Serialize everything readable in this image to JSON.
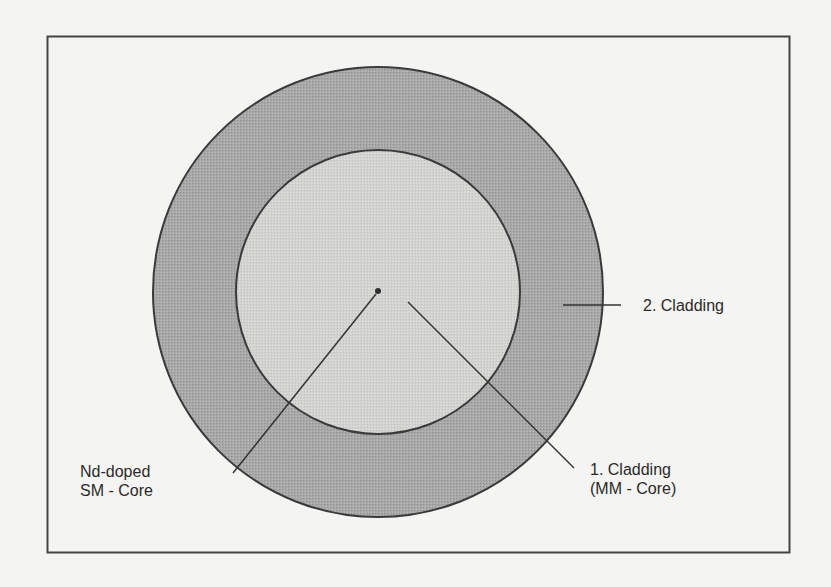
{
  "figure": {
    "type": "cross-section",
    "colors": {
      "background": "#f4f4f2",
      "frame": "#444444",
      "outer_cladding_fill": "#a6a6a6",
      "inner_cladding_fill": "#d2d2d0",
      "outline": "#3a3a3a",
      "core_dot": "#2e2e2e",
      "text": "#2a2a2a"
    },
    "regions": [
      {
        "id": "core",
        "name": "Nd-doped SM - Core"
      },
      {
        "id": "cladding1",
        "name": "1. Cladding (MM - Core)"
      },
      {
        "id": "cladding2",
        "name": "2. Cladding"
      }
    ]
  },
  "labels": {
    "core": {
      "line1": "Nd-doped",
      "line2": "SM - Core"
    },
    "cladding1": {
      "line1": "1. Cladding",
      "line2": "(MM - Core)"
    },
    "cladding2": {
      "line1": "2. Cladding"
    }
  }
}
